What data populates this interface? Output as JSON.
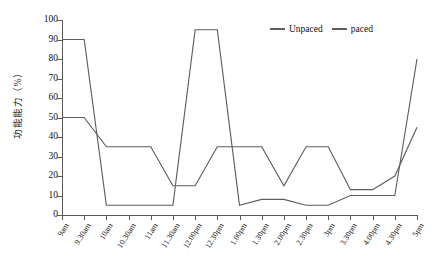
{
  "chart_data": {
    "type": "line",
    "title": "",
    "xlabel": "",
    "ylabel": "功能能力（%）",
    "ylim": [
      0,
      100
    ],
    "yticks": [
      0,
      10,
      20,
      30,
      40,
      50,
      60,
      70,
      80,
      90,
      100
    ],
    "grid": false,
    "legend_position": "top-right",
    "categories": [
      "9am",
      "9.30am",
      "10am",
      "10.30am",
      "11am",
      "11.30am",
      "12.00pm",
      "12.30pm",
      "1.00pm",
      "1.30pm",
      "2.00pm",
      "2.30pm",
      "3pm",
      "3.30pm",
      "4.00pm",
      "4.30pm",
      "5pm"
    ],
    "series": [
      {
        "name": "Unpaced",
        "color": "#5e5e5e",
        "values": [
          90,
          90,
          5,
          5,
          5,
          5,
          95,
          95,
          5,
          8,
          8,
          5,
          5,
          10,
          10,
          10,
          80
        ]
      },
      {
        "name": "paced",
        "color": "#5e5e5e",
        "values": [
          50,
          50,
          35,
          35,
          35,
          15,
          15,
          35,
          35,
          35,
          15,
          35,
          35,
          13,
          13,
          20,
          45
        ]
      }
    ]
  },
  "legend": {
    "entries": [
      {
        "label": "Unpaced"
      },
      {
        "label": "paced"
      }
    ]
  },
  "axis": {
    "y_title": "功能能力（%）"
  },
  "colors": {
    "line": "#5e5e5e",
    "axis": "#595959",
    "text": "#111111",
    "background": "#ffffff"
  }
}
